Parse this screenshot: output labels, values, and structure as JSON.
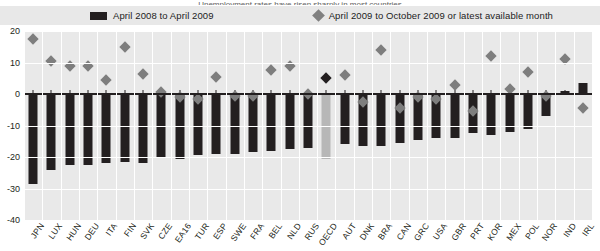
{
  "figure": {
    "title_sliver": "Unemployment rates have risen sharply in most countries",
    "legend": {
      "series1_label": "April 2008 to April 2009",
      "series1_marker": "bar-swatch",
      "series2_label": "April 2009 to October 2009 or latest available month",
      "series2_marker": "diamond-marker"
    }
  },
  "chart_data": {
    "type": "bar",
    "title": "",
    "xlabel": "",
    "ylabel": "",
    "ylim": [
      -40,
      20
    ],
    "yticks": [
      20,
      10,
      0,
      -10,
      -20,
      -30,
      -40
    ],
    "ytick_labels": [
      "20",
      "10",
      "0",
      "-10",
      "-20",
      "-30",
      "-40"
    ],
    "grid": true,
    "legend_position": "top",
    "highlight_category": "OECD",
    "colors": {
      "bars": "#231f20",
      "highlight_bar": "#b7b7b7",
      "diamonds": "#7e7e7e",
      "highlight_diamond": "#231f20",
      "plot_background": "#e9e9e9",
      "gridlines": "#ffffff"
    },
    "categories": [
      "JPN",
      "LUX",
      "HUN",
      "DEU",
      "ITA",
      "FIN",
      "SVK",
      "CZE",
      "EA16",
      "TUR",
      "ESP",
      "SWE",
      "FRA",
      "BEL",
      "NLD",
      "RUS",
      "OECD",
      "AUT",
      "DNK",
      "BRA",
      "CAN",
      "GRC",
      "USA",
      "GBR",
      "PRT",
      "KOR",
      "MEX",
      "POL",
      "NOR",
      "IND",
      "IRL"
    ],
    "series": [
      {
        "name": "April 2008 to April 2009",
        "marker": "bar",
        "values": [
          -28.5,
          -24.0,
          -22.5,
          -22.5,
          -22.0,
          -21.5,
          -22.0,
          -20.0,
          -20.5,
          -19.5,
          -19.0,
          -19.0,
          -18.5,
          -18.0,
          -17.5,
          -17.0,
          -20.5,
          -16.0,
          -16.5,
          -16.5,
          -15.5,
          -14.5,
          -14.0,
          -14.0,
          -12.5,
          -13.0,
          -12.0,
          -11.0,
          -7.0,
          1.0,
          3.5
        ]
      },
      {
        "name": "April 2009 to October 2009 or latest available month",
        "marker": "diamond",
        "values": [
          17.5,
          10.5,
          9.0,
          9.0,
          4.5,
          15.0,
          6.5,
          0.5,
          -1.0,
          -1.5,
          5.5,
          -0.5,
          -0.5,
          7.5,
          9.0,
          0.0,
          5.0,
          6.0,
          -2.5,
          14.0,
          -4.5,
          -1.0,
          -1.5,
          3.0,
          -5.5,
          12.0,
          1.5,
          7.0,
          -0.5,
          11.0,
          -4.5
        ]
      }
    ]
  }
}
